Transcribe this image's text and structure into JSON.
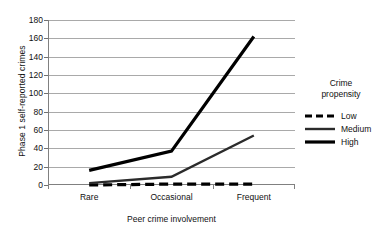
{
  "chart_data": {
    "type": "line",
    "title": "",
    "xlabel": "Peer crime involvement",
    "ylabel": "Phase 1 self-reported crimes",
    "categories": [
      "Rare",
      "Occasional",
      "Frequent"
    ],
    "ylim": [
      0,
      180
    ],
    "yticks": [
      0,
      20,
      40,
      60,
      80,
      100,
      120,
      140,
      160,
      180
    ],
    "ytick_labels": [
      "0",
      "20",
      "40",
      "60",
      "80",
      "100",
      "120",
      "140",
      "160",
      "180"
    ],
    "grid": "horizontal",
    "legend_position": "right",
    "legend_title": "Crime propensity",
    "series": [
      {
        "name": "Low",
        "values": [
          0,
          1,
          1
        ],
        "style": "dashed",
        "color": "#000000",
        "width": 3.2
      },
      {
        "name": "Medium",
        "values": [
          2,
          9,
          54
        ],
        "style": "solid",
        "color": "#2b2b2b",
        "width": 2.4
      },
      {
        "name": "High",
        "values": [
          16,
          37,
          162
        ],
        "style": "solid",
        "color": "#000000",
        "width": 3.2
      }
    ]
  },
  "legend": {
    "title_line_1": "Crime",
    "title_line_2": "propensity",
    "items": [
      {
        "label": "Low"
      },
      {
        "label": "Medium"
      },
      {
        "label": "High"
      }
    ]
  },
  "axes": {
    "y_title": "Phase 1 self-reported crimes",
    "x_title": "Peer crime involvement"
  }
}
